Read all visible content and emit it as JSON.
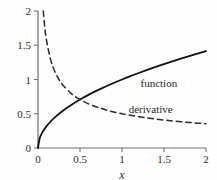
{
  "chart_data": {
    "type": "line",
    "title": "",
    "xlabel": "x",
    "ylabel": "",
    "xlim": [
      0,
      2
    ],
    "ylim": [
      0,
      2
    ],
    "grid": false,
    "legend_position": "inline-annotations",
    "x_ticks": [
      "0",
      "0.5",
      "1",
      "1.5",
      "2"
    ],
    "x_tick_values": [
      0,
      0.5,
      1,
      1.5,
      2
    ],
    "y_ticks": [
      "0",
      "0.5",
      "1",
      "1.5",
      "2"
    ],
    "y_tick_values": [
      0,
      0.5,
      1,
      1.5,
      2
    ],
    "series": [
      {
        "name": "function",
        "formula": "sqrt(x)",
        "style": "solid",
        "color": "#111111",
        "width": 1.8,
        "x": [
          0,
          0.02,
          0.05,
          0.1,
          0.15,
          0.2,
          0.3,
          0.4,
          0.5,
          0.6,
          0.7,
          0.8,
          0.9,
          1,
          1.1,
          1.2,
          1.3,
          1.4,
          1.5,
          1.6,
          1.7,
          1.8,
          1.9,
          2
        ],
        "values": [
          0,
          0.141,
          0.224,
          0.316,
          0.387,
          0.447,
          0.548,
          0.632,
          0.707,
          0.775,
          0.837,
          0.894,
          0.949,
          1,
          1.049,
          1.095,
          1.14,
          1.183,
          1.225,
          1.265,
          1.304,
          1.342,
          1.378,
          1.414
        ]
      },
      {
        "name": "derivative",
        "formula": "1/(2*sqrt(x))",
        "style": "dashed",
        "color": "#2a2a2a",
        "width": 1.5,
        "x": [
          0.0625,
          0.08,
          0.1,
          0.15,
          0.2,
          0.25,
          0.3,
          0.4,
          0.5,
          0.6,
          0.7,
          0.8,
          0.9,
          1,
          1.1,
          1.2,
          1.3,
          1.4,
          1.5,
          1.6,
          1.7,
          1.8,
          1.9,
          2
        ],
        "values": [
          2,
          1.768,
          1.581,
          1.291,
          1.118,
          1,
          0.913,
          0.791,
          0.707,
          0.645,
          0.598,
          0.559,
          0.527,
          0.5,
          0.477,
          0.456,
          0.439,
          0.423,
          0.408,
          0.395,
          0.383,
          0.373,
          0.363,
          0.354
        ]
      }
    ],
    "annotations": [
      {
        "text": "function",
        "x": 1.22,
        "y": 0.93
      },
      {
        "text": "derivative",
        "x": 1.08,
        "y": 0.56
      }
    ]
  },
  "axes": {
    "x_title": "x"
  },
  "labels": {
    "function": "function",
    "derivative": "derivative"
  }
}
